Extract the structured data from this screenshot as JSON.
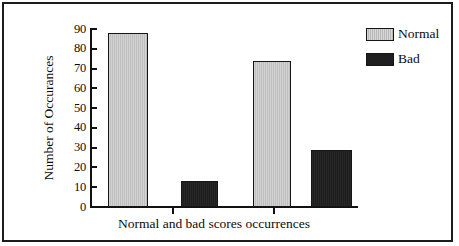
{
  "chart_data": {
    "type": "bar",
    "title": "",
    "subtitle": "",
    "xlabel": "Normal and bad scores occurrences",
    "ylabel": "Number of Occurances",
    "ylim": [
      0,
      90
    ],
    "yticks": [
      "0",
      "10",
      "20",
      "30",
      "40",
      "50",
      "60",
      "70",
      "80",
      "90"
    ],
    "ytick_values": [
      0,
      10,
      20,
      30,
      40,
      50,
      60,
      70,
      80,
      90
    ],
    "grid": false,
    "legend_position": "top-right",
    "categories": [
      "Group 1",
      "Group 2"
    ],
    "series": [
      {
        "name": "Normal",
        "values": [
          88,
          74
        ],
        "color": "#c8c8c8"
      },
      {
        "name": "Bad",
        "values": [
          13,
          29
        ],
        "color": "#1f1f1f"
      }
    ],
    "bars": [
      {
        "series": "Normal",
        "group": "Group 1",
        "value": 88
      },
      {
        "series": "Bad",
        "group": "Group 1",
        "value": 13
      },
      {
        "series": "Normal",
        "group": "Group 2",
        "value": 74
      },
      {
        "series": "Bad",
        "group": "Group 2",
        "value": 29
      }
    ]
  },
  "legend": {
    "items": [
      {
        "label": "Normal",
        "style": "normal",
        "swatch_name": "legend-swatch-normal"
      },
      {
        "label": "Bad",
        "style": "bad",
        "swatch_name": "legend-swatch-bad"
      }
    ]
  },
  "colors": {
    "frame": "#1c1c1c",
    "axis": "#111111",
    "text": "#0c0c0c",
    "normal_fill": "#c8c8c8",
    "bad_fill": "#1f1f1f",
    "background": "#ffffff"
  }
}
